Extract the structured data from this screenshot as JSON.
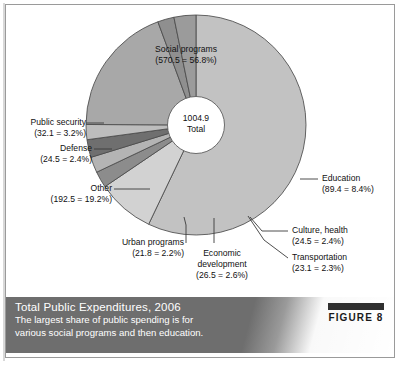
{
  "figure": {
    "badge_label": "FIGURE 8",
    "caption_title": "Total Public Expenditures, 2006",
    "caption_line1": "The largest share of public spending is for",
    "caption_line2": "various social programs and then education."
  },
  "center": {
    "total_value": "1004.9",
    "total_label": "Total"
  },
  "chart_data": {
    "type": "pie",
    "title": "Total Public Expenditures, 2006",
    "subtitle": "The largest share of public spending is for various social programs and then education.",
    "units": "billions",
    "total": 1004.9,
    "total_label": "Total",
    "donut": true,
    "legend": "callout-labels",
    "categories": [
      "Social programs",
      "Education",
      "Culture, health",
      "Transportation",
      "Economic development",
      "Urban programs",
      "Other",
      "Defense",
      "Public security"
    ],
    "values": [
      570.5,
      89.4,
      24.5,
      23.1,
      26.5,
      21.8,
      192.5,
      24.5,
      32.1
    ],
    "percents": [
      56.8,
      8.4,
      2.4,
      2.3,
      2.6,
      2.2,
      19.2,
      2.4,
      3.2
    ],
    "slices": [
      {
        "name": "Social programs",
        "value": 570.5,
        "percent": 56.8,
        "color": "#c2c2c2",
        "label_line1": "Social programs",
        "label_line2": "(570.5 = 56.8%)"
      },
      {
        "name": "Education",
        "value": 89.4,
        "percent": 8.4,
        "color": "#d2d2d2",
        "label_line1": "Education",
        "label_line2": "(89.4 = 8.4%)"
      },
      {
        "name": "Culture, health",
        "value": 24.5,
        "percent": 2.4,
        "color": "#8c8c8c",
        "label_line1": "Culture, health",
        "label_line2": "(24.5 = 2.4%)"
      },
      {
        "name": "Transportation",
        "value": 23.1,
        "percent": 2.3,
        "color": "#b4b4b4",
        "label_line1": "Transportation",
        "label_line2": "(23.1 = 2.3%)"
      },
      {
        "name": "Economic development",
        "value": 26.5,
        "percent": 2.6,
        "color": "#6f6f6f",
        "label_line1": "Economic",
        "label_line2": "development",
        "label_line3": "(26.5 = 2.6%)"
      },
      {
        "name": "Urban programs",
        "value": 21.8,
        "percent": 2.2,
        "color": "#bdbdbd",
        "label_line1": "Urban programs",
        "label_line2": "(21.8 = 2.2%)"
      },
      {
        "name": "Other",
        "value": 192.5,
        "percent": 19.2,
        "color": "#a8a8a8",
        "label_line1": "Other",
        "label_line2": "(192.5 = 19.2%)"
      },
      {
        "name": "Defense",
        "value": 24.5,
        "percent": 2.4,
        "color": "#8f8f8f",
        "label_line1": "Defense",
        "label_line2": "(24.5 = 2.4%)"
      },
      {
        "name": "Public security",
        "value": 32.1,
        "percent": 3.2,
        "color": "#9b9b9b",
        "label_line1": "Public security",
        "label_line2": "(32.1 = 3.2%)"
      }
    ]
  }
}
